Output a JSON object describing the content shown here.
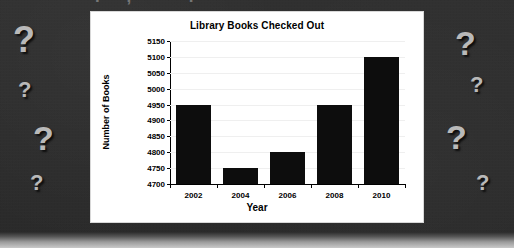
{
  "background": {
    "color": "#2e2e2e",
    "bottom_band_color": "#c9c9c9",
    "cropped_headline_glyphs": ". , ' .",
    "question_marks": [
      {
        "text": "?",
        "x": 13,
        "y": 22,
        "size": 36
      },
      {
        "text": "?",
        "x": 18,
        "y": 79,
        "size": 22
      },
      {
        "text": "?",
        "x": 33,
        "y": 121,
        "size": 34
      },
      {
        "text": "?",
        "x": 30,
        "y": 172,
        "size": 22
      },
      {
        "text": "?",
        "x": 455,
        "y": 26,
        "size": 34
      },
      {
        "text": "?",
        "x": 470,
        "y": 74,
        "size": 22
      },
      {
        "text": "?",
        "x": 446,
        "y": 120,
        "size": 34
      },
      {
        "text": "?",
        "x": 476,
        "y": 172,
        "size": 22
      }
    ],
    "qmark_color": "#b9b9b9"
  },
  "chart_data": {
    "type": "bar",
    "title": "Library Books Checked Out",
    "xlabel": "Year",
    "ylabel": "Number of Books",
    "categories": [
      "2002",
      "2004",
      "2006",
      "2008",
      "2010"
    ],
    "values": [
      4950,
      4750,
      4800,
      4950,
      5100
    ],
    "ylim": [
      4700,
      5150
    ],
    "ytick_step": 50,
    "ytick_labels": [
      "4700",
      "4750",
      "4800",
      "4850",
      "4900",
      "4950",
      "5000",
      "5050",
      "5100",
      "5150"
    ],
    "grid": true,
    "legend": "none",
    "bar_color": "#0d0d0d",
    "plot_background": "#ffffff"
  }
}
